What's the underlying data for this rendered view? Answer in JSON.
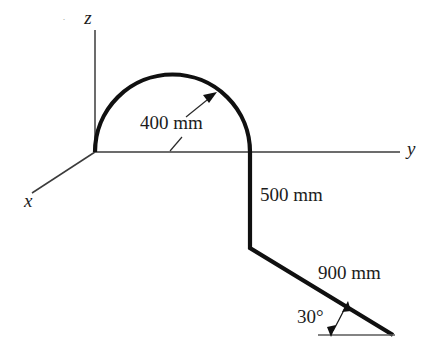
{
  "figure": {
    "background_color": "#ffffff",
    "line_color": "#101010",
    "axis_color": "#3b3b3b"
  },
  "axes": {
    "z_label": "z",
    "y_label": "y",
    "x_label": "x",
    "origin": {
      "x": 95,
      "y": 152
    },
    "z_tip": {
      "x": 95,
      "y": 30
    },
    "y_tip": {
      "x": 400,
      "y": 152
    },
    "x_tip": {
      "x": 32,
      "y": 193
    }
  },
  "dimensions": [
    {
      "name": "arc-radius",
      "label": "400 mm",
      "x": 140,
      "y": 129
    },
    {
      "name": "vertical-drop",
      "label": "500 mm",
      "x": 260,
      "y": 201
    },
    {
      "name": "inclined-length",
      "label": "900 mm",
      "x": 318,
      "y": 279
    },
    {
      "name": "incline-angle",
      "label": "30°",
      "x": 297,
      "y": 323
    }
  ],
  "geometry": {
    "arc": {
      "start": {
        "x": 95,
        "y": 152
      },
      "end": {
        "x": 250,
        "y": 152
      },
      "radius": 77.5,
      "apex_y": 68,
      "sweep": "semicircle"
    },
    "vertical_segment": {
      "from": {
        "x": 250,
        "y": 152
      },
      "to": {
        "x": 250,
        "y": 248
      }
    },
    "inclined_segment": {
      "from": {
        "x": 250,
        "y": 248
      },
      "to": {
        "x": 393,
        "y": 335
      },
      "angle_deg": 30
    },
    "angle_reference_line": {
      "from": {
        "x": 318,
        "y": 335
      },
      "to": {
        "x": 395,
        "y": 335
      }
    }
  },
  "annotations": {
    "stray_mark": "·"
  }
}
